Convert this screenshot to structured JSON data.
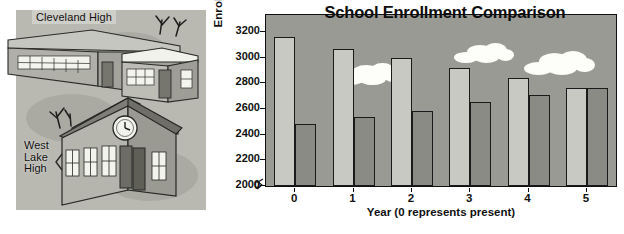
{
  "illustration": {
    "cleveland_label": "Cleveland High",
    "westlake_label": "West\nLake\nHigh"
  },
  "chart_data": {
    "type": "bar",
    "title": "School Enrollment Comparison",
    "xlabel": "Year (0 represents present)",
    "ylabel": "Enrollment",
    "categories": [
      "0",
      "1",
      "2",
      "3",
      "4",
      "5"
    ],
    "series": [
      {
        "name": "Cleveland High",
        "color": "#c9c9c3",
        "values": [
          3160,
          3070,
          3000,
          2920,
          2840,
          2765
        ]
      },
      {
        "name": "West Lake High",
        "color": "#8b8b85",
        "values": [
          2485,
          2540,
          2585,
          2655,
          2710,
          2765
        ]
      }
    ],
    "yticks": [
      "0",
      "2000",
      "2200",
      "2400",
      "2600",
      "2800",
      "3000",
      "3200"
    ],
    "ylim": [
      2000,
      3200
    ],
    "axis_break": true,
    "grid": false,
    "legend": "none",
    "background_color": "#9a9a95"
  },
  "decorations": {
    "clouds": [
      {
        "x": 72,
        "y": 48,
        "w": 62,
        "h": 22
      },
      {
        "x": 188,
        "y": 28,
        "w": 58,
        "h": 20
      },
      {
        "x": 258,
        "y": 36,
        "w": 68,
        "h": 24
      }
    ]
  }
}
